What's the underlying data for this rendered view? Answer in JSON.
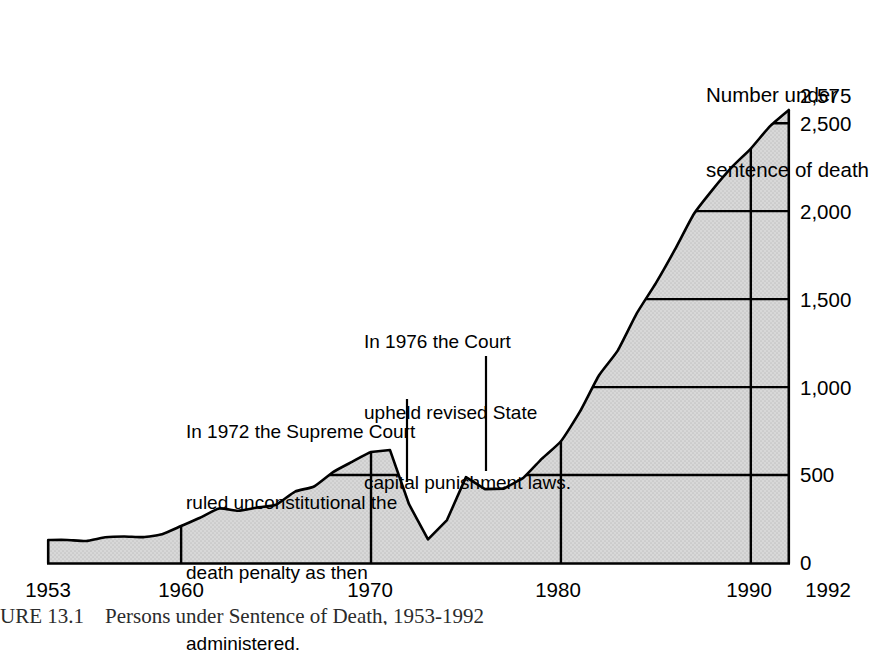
{
  "chart_data": {
    "type": "area",
    "title": "Number under sentence of death",
    "xlabel": "",
    "ylabel": "Number under sentence of death",
    "xlim": [
      1953,
      1992
    ],
    "ylim": [
      0,
      2575
    ],
    "grid": true,
    "legend_position": "none",
    "x_tick_labels": [
      "1953",
      "1960",
      "1970",
      "1980",
      "1990",
      "1992"
    ],
    "x_ticks": [
      1953,
      1960,
      1970,
      1980,
      1990,
      1992
    ],
    "y_tick_labels": [
      "0",
      "500",
      "1,000",
      "1,500",
      "2,000",
      "2,500",
      "2,575"
    ],
    "y_ticks": [
      0,
      500,
      1000,
      1500,
      2000,
      2500,
      2575
    ],
    "series_name": "Persons under sentence of death",
    "x": [
      1953,
      1954,
      1955,
      1956,
      1957,
      1958,
      1959,
      1960,
      1961,
      1962,
      1963,
      1964,
      1965,
      1966,
      1967,
      1968,
      1969,
      1970,
      1971,
      1972,
      1973,
      1974,
      1975,
      1976,
      1977,
      1978,
      1979,
      1980,
      1981,
      1982,
      1983,
      1984,
      1985,
      1986,
      1987,
      1988,
      1989,
      1990,
      1991,
      1992
    ],
    "values": [
      131,
      131,
      125,
      146,
      151,
      147,
      164,
      210,
      257,
      310,
      297,
      315,
      331,
      406,
      435,
      517,
      575,
      631,
      642,
      334,
      134,
      244,
      488,
      420,
      423,
      482,
      593,
      692,
      860,
      1066,
      1209,
      1420,
      1591,
      1781,
      1984,
      2124,
      2250,
      2356,
      2482,
      2575
    ],
    "annotations": [
      {
        "text": "In 1972 the Supreme Court\nruled unconstitutional the\ndeath penalty as then\nadministered.",
        "points_to_year": 1972
      },
      {
        "text": "In 1976 the Court\nupheld revised State\ncapital punishment laws.",
        "points_to_year": 1976
      }
    ],
    "colors": {
      "area_fill": "#d4d4d4",
      "line": "#000000",
      "grid": "#000000",
      "axis": "#000000",
      "text": "#000000"
    },
    "caption": "URE 13.1    Persons under Sentence of Death, 1953-1992"
  },
  "y_axis": {
    "labels": [
      {
        "text": "2,575"
      },
      {
        "text": "2,500"
      },
      {
        "text": "2,000"
      },
      {
        "text": "1,500"
      },
      {
        "text": "1,000"
      },
      {
        "text": "500"
      },
      {
        "text": "0"
      }
    ]
  },
  "x_axis": {
    "labels": [
      {
        "text": "1953"
      },
      {
        "text": "1960"
      },
      {
        "text": "1970"
      },
      {
        "text": "1980"
      },
      {
        "text": "1990"
      },
      {
        "text": "1992"
      }
    ]
  },
  "series_title": {
    "line1": "Number under",
    "line2": "sentence of death"
  },
  "annotation_1972": {
    "line1": "In 1972 the Supreme Court",
    "line2": "ruled unconstitutional the",
    "line3": "death penalty as then",
    "line4": "administered."
  },
  "annotation_1976": {
    "line1": "In 1976 the Court",
    "line2": "upheld revised State",
    "line3": "capital punishment laws."
  },
  "caption": {
    "text": "URE 13.1    Persons under Sentence of Death, 1953-1992"
  }
}
